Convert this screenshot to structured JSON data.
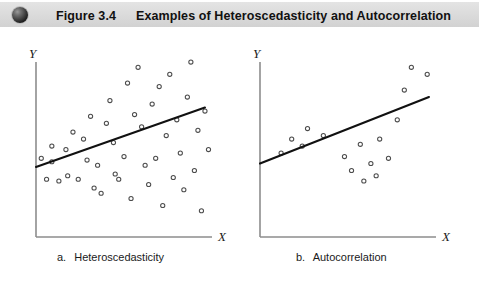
{
  "header": {
    "icon": "sphere-bullet-icon",
    "figure_number": "Figure 3.4",
    "title": "Examples of Heteroscedasticity and Autocorrelation",
    "band_color": "#dcdcdc",
    "text_color": "#111111"
  },
  "panels": [
    {
      "id": "a",
      "caption_letter": "a.",
      "caption_text": "Heteroscedasticity",
      "x_axis_label": "X",
      "y_axis_label": "Y"
    },
    {
      "id": "b",
      "caption_letter": "b.",
      "caption_text": "Autocorrelation",
      "x_axis_label": "X",
      "y_axis_label": "Y"
    }
  ],
  "chart_data": [
    {
      "type": "scatter",
      "title": "a. Heteroscedasticity",
      "xlabel": "X",
      "ylabel": "Y",
      "xlim": [
        0,
        100
      ],
      "ylim": [
        0,
        100
      ],
      "grid": false,
      "legend": "none",
      "marker": "open-circle",
      "annotation": "Scatter fans out with increasing X: residual variance grows, illustrating non-constant error variance.",
      "regression_line": {
        "name": "fitted regression line",
        "x": [
          0,
          96
        ],
        "y": [
          40,
          74
        ]
      },
      "points": [
        {
          "x": 3,
          "y": 45
        },
        {
          "x": 6,
          "y": 33
        },
        {
          "x": 9,
          "y": 52
        },
        {
          "x": 9,
          "y": 43
        },
        {
          "x": 13,
          "y": 32
        },
        {
          "x": 17,
          "y": 50
        },
        {
          "x": 18,
          "y": 35
        },
        {
          "x": 21,
          "y": 60
        },
        {
          "x": 24,
          "y": 33
        },
        {
          "x": 27,
          "y": 56
        },
        {
          "x": 29,
          "y": 44
        },
        {
          "x": 31,
          "y": 69
        },
        {
          "x": 33,
          "y": 28
        },
        {
          "x": 35,
          "y": 41
        },
        {
          "x": 37,
          "y": 25
        },
        {
          "x": 40,
          "y": 65
        },
        {
          "x": 42,
          "y": 78
        },
        {
          "x": 44,
          "y": 54
        },
        {
          "x": 45,
          "y": 36
        },
        {
          "x": 47,
          "y": 33
        },
        {
          "x": 50,
          "y": 46
        },
        {
          "x": 52,
          "y": 88
        },
        {
          "x": 54,
          "y": 22
        },
        {
          "x": 56,
          "y": 70
        },
        {
          "x": 58,
          "y": 97
        },
        {
          "x": 60,
          "y": 63
        },
        {
          "x": 62,
          "y": 41
        },
        {
          "x": 64,
          "y": 30
        },
        {
          "x": 66,
          "y": 76
        },
        {
          "x": 68,
          "y": 45
        },
        {
          "x": 70,
          "y": 86
        },
        {
          "x": 72,
          "y": 18
        },
        {
          "x": 74,
          "y": 58
        },
        {
          "x": 76,
          "y": 93
        },
        {
          "x": 78,
          "y": 34
        },
        {
          "x": 80,
          "y": 67
        },
        {
          "x": 82,
          "y": 48
        },
        {
          "x": 84,
          "y": 27
        },
        {
          "x": 86,
          "y": 80
        },
        {
          "x": 88,
          "y": 100
        },
        {
          "x": 90,
          "y": 38
        },
        {
          "x": 92,
          "y": 61
        },
        {
          "x": 94,
          "y": 15
        },
        {
          "x": 96,
          "y": 72
        },
        {
          "x": 98,
          "y": 50
        }
      ]
    },
    {
      "type": "scatter",
      "title": "b. Autocorrelation",
      "xlabel": "X",
      "ylabel": "Y",
      "xlim": [
        0,
        100
      ],
      "ylim": [
        0,
        100
      ],
      "grid": false,
      "legend": "none",
      "marker": "open-circle",
      "annotation": "Residuals occur in runs: a group above the line, then a group below, then above again, illustrating serially correlated errors.",
      "regression_line": {
        "name": "fitted regression line",
        "x": [
          0,
          96
        ],
        "y": [
          42,
          80
        ]
      },
      "points": [
        {
          "x": 12,
          "y": 48
        },
        {
          "x": 18,
          "y": 56
        },
        {
          "x": 24,
          "y": 52
        },
        {
          "x": 27,
          "y": 62
        },
        {
          "x": 36,
          "y": 58
        },
        {
          "x": 48,
          "y": 46
        },
        {
          "x": 52,
          "y": 38
        },
        {
          "x": 57,
          "y": 53
        },
        {
          "x": 59,
          "y": 32
        },
        {
          "x": 63,
          "y": 42
        },
        {
          "x": 66,
          "y": 35
        },
        {
          "x": 68,
          "y": 56
        },
        {
          "x": 73,
          "y": 45
        },
        {
          "x": 78,
          "y": 67
        },
        {
          "x": 82,
          "y": 84
        },
        {
          "x": 86,
          "y": 97
        },
        {
          "x": 95,
          "y": 93
        }
      ]
    }
  ]
}
